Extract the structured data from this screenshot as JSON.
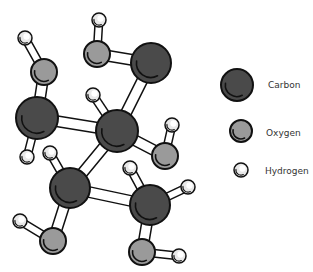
{
  "diagram": {
    "colors": {
      "carbon": "#4a4a4a",
      "oxygen": "#9a9a9a",
      "hydrogen": "#e8e8e8",
      "outline": "#111111",
      "bond": "#ffffff"
    },
    "atoms": [
      {
        "id": "H1",
        "type": "hydrogen",
        "x": 25,
        "y": 38,
        "r": 7
      },
      {
        "id": "O1",
        "type": "oxygen",
        "x": 44,
        "y": 72,
        "r": 13
      },
      {
        "id": "C1",
        "type": "carbon",
        "x": 37,
        "y": 118,
        "r": 21
      },
      {
        "id": "H2",
        "type": "hydrogen",
        "x": 27,
        "y": 157,
        "r": 7
      },
      {
        "id": "H3",
        "type": "hydrogen",
        "x": 99,
        "y": 20,
        "r": 7
      },
      {
        "id": "O2",
        "type": "oxygen",
        "x": 97,
        "y": 54,
        "r": 13
      },
      {
        "id": "C2",
        "type": "carbon",
        "x": 151,
        "y": 63,
        "r": 20
      },
      {
        "id": "H4",
        "type": "hydrogen",
        "x": 93,
        "y": 95,
        "r": 7
      },
      {
        "id": "C3",
        "type": "carbon",
        "x": 117,
        "y": 131,
        "r": 21
      },
      {
        "id": "H5",
        "type": "hydrogen",
        "x": 172,
        "y": 125,
        "r": 7
      },
      {
        "id": "O3",
        "type": "oxygen",
        "x": 165,
        "y": 156,
        "r": 13
      },
      {
        "id": "H6",
        "type": "hydrogen",
        "x": 50,
        "y": 153,
        "r": 7
      },
      {
        "id": "C4",
        "type": "carbon",
        "x": 70,
        "y": 188,
        "r": 20
      },
      {
        "id": "H7",
        "type": "hydrogen",
        "x": 20,
        "y": 221,
        "r": 7
      },
      {
        "id": "O4",
        "type": "oxygen",
        "x": 53,
        "y": 241,
        "r": 13
      },
      {
        "id": "H8",
        "type": "hydrogen",
        "x": 130,
        "y": 168,
        "r": 7
      },
      {
        "id": "C5",
        "type": "carbon",
        "x": 150,
        "y": 205,
        "r": 20
      },
      {
        "id": "H9",
        "type": "hydrogen",
        "x": 188,
        "y": 187,
        "r": 7
      },
      {
        "id": "O5",
        "type": "oxygen",
        "x": 142,
        "y": 252,
        "r": 13
      },
      {
        "id": "H10",
        "type": "hydrogen",
        "x": 179,
        "y": 256,
        "r": 7
      }
    ],
    "bonds": [
      [
        "H1",
        "O1"
      ],
      [
        "O1",
        "C1"
      ],
      [
        "C1",
        "H2"
      ],
      [
        "C1",
        "C3"
      ],
      [
        "H3",
        "O2"
      ],
      [
        "O2",
        "C2"
      ],
      [
        "C2",
        "C3"
      ],
      [
        "H4",
        "C3"
      ],
      [
        "C3",
        "O3"
      ],
      [
        "H5",
        "O3"
      ],
      [
        "C3",
        "C4"
      ],
      [
        "H6",
        "C4"
      ],
      [
        "C4",
        "O4"
      ],
      [
        "H7",
        "O4"
      ],
      [
        "C4",
        "C5"
      ],
      [
        "H8",
        "C5"
      ],
      [
        "C5",
        "H9"
      ],
      [
        "C5",
        "O5"
      ],
      [
        "O5",
        "H10"
      ]
    ]
  },
  "legend": {
    "items": [
      {
        "label": "Carbon",
        "type": "carbon",
        "x": 237,
        "y": 85,
        "r": 16,
        "label_x": 268,
        "label_y": 80
      },
      {
        "label": "Oxygen",
        "type": "oxygen",
        "x": 241,
        "y": 131,
        "r": 11,
        "label_x": 266,
        "label_y": 128
      },
      {
        "label": "Hydrogen",
        "type": "hydrogen",
        "x": 241,
        "y": 170,
        "r": 7,
        "label_x": 265,
        "label_y": 166
      }
    ]
  }
}
